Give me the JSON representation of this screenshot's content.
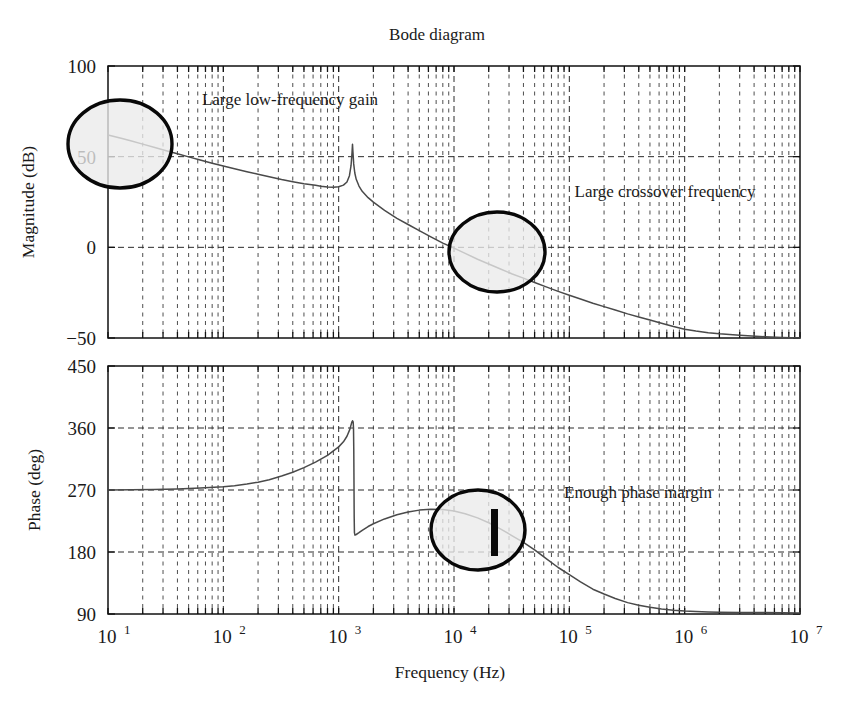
{
  "chart_data": {
    "type": "line",
    "title": "Bode diagram",
    "xlabel": "Frequency (Hz)",
    "xscale": "log",
    "xlim": [
      10,
      10000000
    ],
    "xticks": [
      10,
      100,
      1000,
      10000,
      100000,
      1000000,
      10000000
    ],
    "xticklabels": [
      "10¹",
      "10²",
      "10³",
      "10⁴",
      "10⁵",
      "10⁶",
      "10⁷"
    ],
    "xtick_bases": [
      "10",
      "10",
      "10",
      "10",
      "10",
      "10",
      "10"
    ],
    "xtick_exponents": [
      "1",
      "2",
      "3",
      "4",
      "5",
      "6",
      "7"
    ],
    "grid": true,
    "subplots": [
      {
        "name": "magnitude",
        "ylabel": "Magnitude (dB)",
        "ylim": [
          -50,
          100
        ],
        "yticks": [
          -50,
          0,
          50,
          100
        ],
        "yticklabels": [
          "−50",
          "0",
          "50",
          "100"
        ],
        "series": [
          {
            "name": "magnitude-response",
            "points": [
              [
                10,
                62.0
              ],
              [
                13,
                60.2
              ],
              [
                16,
                58.6
              ],
              [
                20,
                56.9
              ],
              [
                25,
                55.2
              ],
              [
                32,
                53.3
              ],
              [
                40,
                51.6
              ],
              [
                50,
                49.9
              ],
              [
                63,
                48.2
              ],
              [
                80,
                46.4
              ],
              [
                100,
                44.8
              ],
              [
                125,
                43.3
              ],
              [
                160,
                41.7
              ],
              [
                200,
                40.3
              ],
              [
                250,
                38.9
              ],
              [
                320,
                37.4
              ],
              [
                400,
                36.2
              ],
              [
                500,
                35.1
              ],
              [
                630,
                34.2
              ],
              [
                700,
                33.7
              ],
              [
                800,
                33.3
              ],
              [
                900,
                33.2
              ],
              [
                1000,
                33.4
              ],
              [
                1100,
                34.3
              ],
              [
                1180,
                36.0
              ],
              [
                1240,
                39.5
              ],
              [
                1280,
                45.0
              ],
              [
                1305,
                52.0
              ],
              [
                1318,
                56.8
              ],
              [
                1330,
                52.5
              ],
              [
                1350,
                46.0
              ],
              [
                1380,
                41.0
              ],
              [
                1420,
                37.5
              ],
              [
                1500,
                33.8
              ],
              [
                1600,
                30.9
              ],
              [
                1800,
                27.4
              ],
              [
                2000,
                24.9
              ],
              [
                2500,
                20.4
              ],
              [
                3200,
                16.0
              ],
              [
                4000,
                12.6
              ],
              [
                5000,
                9.2
              ],
              [
                6300,
                5.8
              ],
              [
                8000,
                2.3
              ],
              [
                10000,
                -0.4
              ],
              [
                12500,
                -3.3
              ],
              [
                16000,
                -6.6
              ],
              [
                20000,
                -9.2
              ],
              [
                25000,
                -11.8
              ],
              [
                32000,
                -14.7
              ],
              [
                40000,
                -17.0
              ],
              [
                50000,
                -19.4
              ],
              [
                63000,
                -21.8
              ],
              [
                80000,
                -24.3
              ],
              [
                100000,
                -26.4
              ],
              [
                125000,
                -28.5
              ],
              [
                160000,
                -30.8
              ],
              [
                200000,
                -32.7
              ],
              [
                250000,
                -34.6
              ],
              [
                320000,
                -36.7
              ],
              [
                400000,
                -38.4
              ],
              [
                500000,
                -40.1
              ],
              [
                630000,
                -41.9
              ],
              [
                800000,
                -43.7
              ],
              [
                1000000,
                -45.2
              ],
              [
                1250000,
                -46.2
              ],
              [
                1600000,
                -47.1
              ],
              [
                2000000,
                -47.7
              ],
              [
                3000000,
                -48.5
              ],
              [
                5000000,
                -49.3
              ],
              [
                7000000,
                -49.7
              ],
              [
                10000000,
                -50.0
              ]
            ]
          }
        ],
        "annotations": [
          {
            "name": "large-low-frequency-gain",
            "text": "Large low-frequency gain",
            "text_x": 290,
            "text_y": 105
          },
          {
            "name": "large-crossover-frequency",
            "text": "Large crossover frequency",
            "text_x": 665,
            "text_y": 197
          }
        ],
        "callouts": [
          {
            "name": "low-frequency-gain-callout",
            "cx": 120,
            "cy": 144,
            "rx": 52,
            "ry": 44
          },
          {
            "name": "crossover-frequency-callout",
            "cx": 497,
            "cy": 252,
            "rx": 48,
            "ry": 40
          }
        ]
      },
      {
        "name": "phase",
        "ylabel": "Phase (deg)",
        "ylim": [
          90,
          450
        ],
        "yticks": [
          90,
          180,
          270,
          360,
          450
        ],
        "yticklabels": [
          "90",
          "180",
          "270",
          "360",
          "450"
        ],
        "series": [
          {
            "name": "phase-response",
            "points": [
              [
                10,
                270.0
              ],
              [
                16,
                270.3
              ],
              [
                25,
                270.8
              ],
              [
                40,
                271.6
              ],
              [
                63,
                272.8
              ],
              [
                100,
                274.6
              ],
              [
                125,
                276.2
              ],
              [
                160,
                278.6
              ],
              [
                200,
                281.4
              ],
              [
                250,
                285.0
              ],
              [
                320,
                290.2
              ],
              [
                400,
                295.8
              ],
              [
                500,
                302.4
              ],
              [
                630,
                310.4
              ],
              [
                800,
                320.2
              ],
              [
                1000,
                332.6
              ],
              [
                1100,
                340.0
              ],
              [
                1180,
                348.0
              ],
              [
                1250,
                358.0
              ],
              [
                1300,
                368.5
              ],
              [
                1320,
                370.5
              ],
              [
                1335,
                369.0
              ],
              [
                1345,
                360.0
              ],
              [
                1352,
                330.0
              ],
              [
                1358,
                280.0
              ],
              [
                1363,
                232.0
              ],
              [
                1370,
                208.0
              ],
              [
                1385,
                204.5
              ],
              [
                1420,
                205.4
              ],
              [
                1500,
                208.0
              ],
              [
                1600,
                211.5
              ],
              [
                1800,
                217.0
              ],
              [
                2000,
                221.0
              ],
              [
                2500,
                228.0
              ],
              [
                3200,
                234.0
              ],
              [
                4000,
                238.0
              ],
              [
                5000,
                240.8
              ],
              [
                6300,
                242.0
              ],
              [
                8000,
                241.6
              ],
              [
                10000,
                239.5
              ],
              [
                12500,
                235.5
              ],
              [
                16000,
                229.5
              ],
              [
                20000,
                222.5
              ],
              [
                25000,
                214.0
              ],
              [
                32000,
                203.5
              ],
              [
                40000,
                194.0
              ],
              [
                50000,
                183.0
              ],
              [
                63000,
                170.5
              ],
              [
                80000,
                157.5
              ],
              [
                100000,
                147.0
              ],
              [
                125000,
                136.5
              ],
              [
                160000,
                126.0
              ],
              [
                200000,
                119.0
              ],
              [
                250000,
                112.5
              ],
              [
                320000,
                106.5
              ],
              [
                400000,
                102.8
              ],
              [
                500000,
                99.8
              ],
              [
                630000,
                97.4
              ],
              [
                800000,
                95.5
              ],
              [
                1000000,
                94.3
              ],
              [
                1250000,
                93.5
              ],
              [
                1600000,
                93.0
              ],
              [
                2000000,
                92.7
              ],
              [
                3000000,
                92.3
              ],
              [
                5000000,
                92.0
              ],
              [
                7000000,
                91.8
              ],
              [
                10000000,
                91.6
              ]
            ]
          }
        ],
        "annotations": [
          {
            "name": "enough-phase-margin",
            "text": "Enough phase margin",
            "text_x": 638,
            "text_y": 498
          }
        ],
        "callouts": [
          {
            "name": "phase-margin-callout",
            "cx": 478,
            "cy": 530,
            "rx": 47,
            "ry": 40
          }
        ],
        "markers": [
          {
            "name": "phase-margin-bar",
            "x": 491,
            "y_top": 509,
            "width": 7,
            "height": 47
          }
        ]
      }
    ]
  },
  "colors": {
    "curve": "#4a4a4a",
    "frame": "#111111",
    "grid": "#2b2b2b",
    "callout_fill": "#ebebeb",
    "callout_stroke": "#080808",
    "background": "#ffffff"
  }
}
